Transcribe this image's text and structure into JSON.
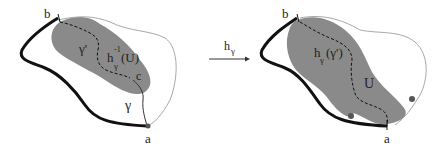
{
  "figure": {
    "left_panel": {
      "labels": {
        "b": "b",
        "a": "a",
        "c": "c",
        "gamma": "γ",
        "gamma_prime": "γ'",
        "preimage_h": "h",
        "preimage_sup": "-1",
        "preimage_sub": "γ",
        "preimage_arg": "(U)"
      }
    },
    "arrow": {
      "label_h": "h",
      "label_sub": "γ"
    },
    "right_panel": {
      "labels": {
        "b": "b",
        "a": "a",
        "image_h": "h",
        "image_sub": "γ",
        "image_arg": "(γ')",
        "U": "U"
      }
    },
    "colors": {
      "region_fill": "#8a8a8a",
      "thick_curve": "#111111",
      "thin_curve": "#a8a8a8",
      "dot": "#555555"
    }
  }
}
